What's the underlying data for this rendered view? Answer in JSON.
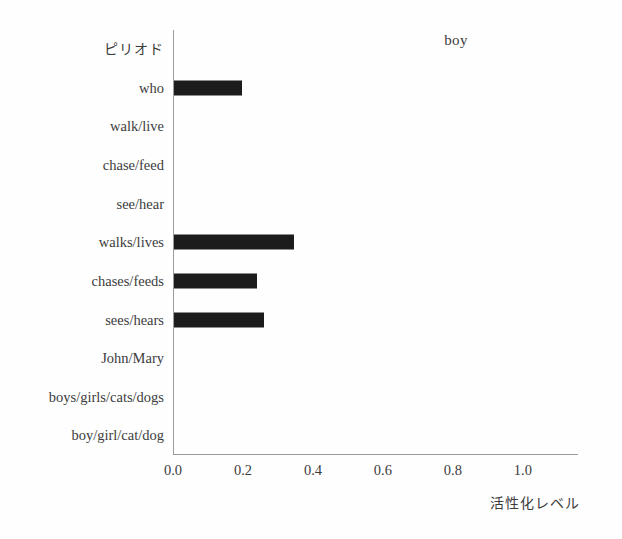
{
  "chart_data": {
    "type": "bar",
    "orientation": "horizontal",
    "title": "boy",
    "xlabel": "活性化レベル",
    "ylabel": "",
    "xlim": [
      0.0,
      1.1576
    ],
    "grid": false,
    "legend": null,
    "xticks": [
      "0.0",
      "0.2",
      "0.4",
      "0.6",
      "0.8",
      "1.0"
    ],
    "xtick_values": [
      0.0,
      0.2,
      0.4,
      0.6,
      0.8,
      1.0
    ],
    "categories": [
      "ピリオド",
      "who",
      "walk/live",
      "chase/feed",
      "see/hear",
      "walks/lives",
      "chases/feeds",
      "sees/hears",
      "John/Mary",
      "boys/girls/cats/dogs",
      "boy/girl/cat/dog"
    ],
    "values": [
      0.0,
      0.195,
      0.0,
      0.0,
      0.0,
      0.343,
      0.237,
      0.257,
      0.0,
      0.0,
      0.0
    ],
    "bar_color": "#1c1c1c"
  },
  "figure": {
    "background_color": "#fefefe",
    "axis_color": "#9a9a9a",
    "text_color": "#3c3c3c"
  }
}
